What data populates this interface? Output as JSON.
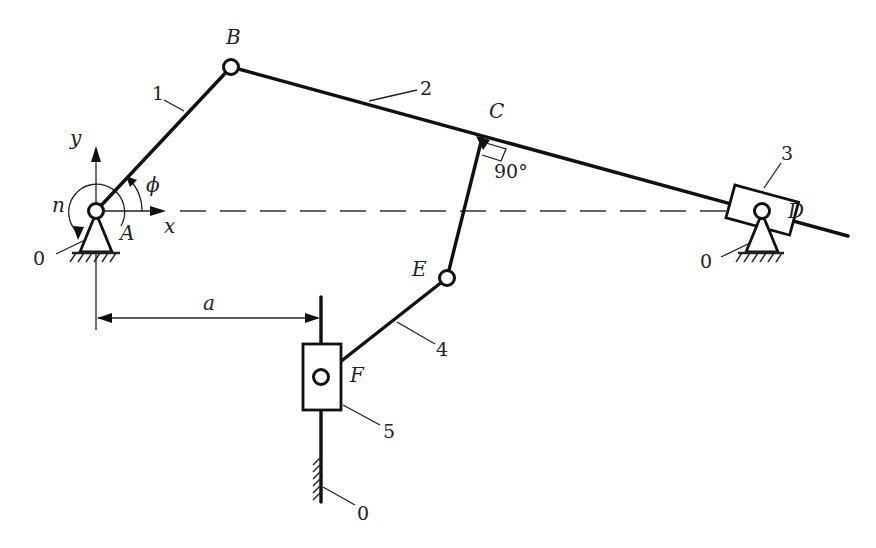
{
  "diagram": {
    "type": "planar linkage mechanism (kinematic scheme)",
    "points": {
      "A": {
        "label": "A",
        "x": 96,
        "y": 211
      },
      "B": {
        "label": "B",
        "x": 231,
        "y": 67
      },
      "C": {
        "label": "C",
        "x": 482,
        "y": 138
      },
      "D": {
        "label": "D",
        "x": 762,
        "y": 211
      },
      "E": {
        "label": "E",
        "x": 447,
        "y": 278
      },
      "F": {
        "label": "F",
        "x": 321,
        "y": 377
      }
    },
    "links": [
      {
        "id": "1",
        "label": "1",
        "from": "A",
        "to": "B"
      },
      {
        "id": "2",
        "label": "2",
        "from": "B",
        "to": "end",
        "through": [
          "C",
          "D"
        ]
      },
      {
        "id": "3",
        "label": "3",
        "desc": "slider at D"
      },
      {
        "id": "4",
        "label": "4",
        "from": "E",
        "to": "F"
      },
      {
        "id": "5",
        "label": "5",
        "desc": "slider at F on vertical guide"
      }
    ],
    "ground_labels": [
      "0",
      "0",
      "0"
    ],
    "axes": {
      "x_label": "x",
      "y_label": "y"
    },
    "annotations": {
      "angle_label": "ϕ",
      "rotation_label": "n",
      "right_angle_label": "90°",
      "dimension_label": "a"
    }
  }
}
